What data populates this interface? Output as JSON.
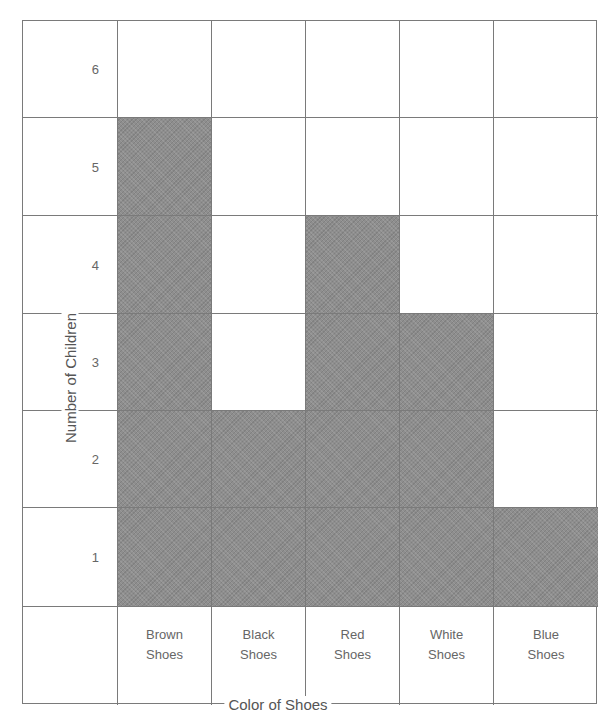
{
  "chart_data": {
    "type": "bar",
    "title": "",
    "xlabel": "Color of Shoes",
    "ylabel": "Number of Children",
    "categories": [
      "Brown Shoes",
      "Black Shoes",
      "Red Shoes",
      "White Shoes",
      "Blue Shoes"
    ],
    "values": [
      5,
      2,
      4,
      3,
      1
    ],
    "ylim": [
      0,
      6
    ],
    "yticks": [
      1,
      2,
      3,
      4,
      5,
      6
    ],
    "grid": true,
    "legend": null,
    "style": "pictograph grid with shaded cells"
  },
  "axis": {
    "ylabel": "Number of Children",
    "xlabel": "Color of Shoes",
    "yticks": [
      "6",
      "5",
      "4",
      "3",
      "2",
      "1"
    ],
    "xticks": [
      {
        "line1": "Brown",
        "line2": "Shoes"
      },
      {
        "line1": "Black",
        "line2": "Shoes"
      },
      {
        "line1": "Red",
        "line2": "Shoes"
      },
      {
        "line1": "White",
        "line2": "Shoes"
      },
      {
        "line1": "Blue",
        "line2": "Shoes"
      }
    ]
  },
  "colors": {
    "fill": "#8e8e8e",
    "grid": "#7a7a7a",
    "background": "#ffffff"
  }
}
